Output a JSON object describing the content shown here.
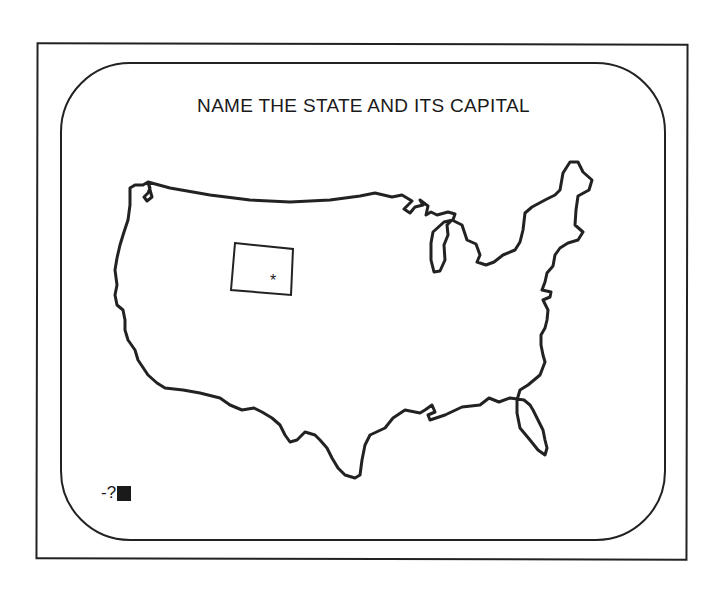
{
  "screen": {
    "title": "NAME THE STATE AND ITS CAPITAL",
    "prompt_text": "-?",
    "capital_marker": "*",
    "highlighted_state": "state-outline",
    "map": "us-outline-map"
  },
  "colors": {
    "line": "#222222",
    "background": "#ffffff"
  }
}
